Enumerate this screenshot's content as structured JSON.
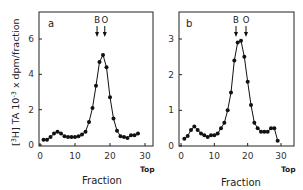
{
  "figure": {
    "ylabel_prefix": "[",
    "ylabel_iso": "3",
    "ylabel_elem": "H] TA 10",
    "ylabel_exp": "-3",
    "ylabel_suffix": " x dpm/fraction",
    "ylabel_full": "[3H] TA 10^-3 x dpm/fraction"
  },
  "chart_data": [
    {
      "type": "line",
      "panel": "a",
      "title": "",
      "xlabel": "Fraction",
      "ylabel": "[3H] TA 10^-3 x dpm/fraction",
      "x_end_label": "Top",
      "xlim": [
        0,
        32
      ],
      "ylim": [
        0,
        7.5
      ],
      "xticks": [
        0,
        10,
        20,
        30
      ],
      "yticks": [
        0,
        2,
        4,
        6
      ],
      "grid": false,
      "markers": [
        {
          "label": "B",
          "x": 16.3
        },
        {
          "label": "O",
          "x": 18.5
        }
      ],
      "x": [
        1,
        2,
        3,
        4,
        5,
        6,
        7,
        8,
        9,
        10,
        11,
        12,
        13,
        14,
        15,
        16,
        17,
        18,
        19,
        20,
        21,
        22,
        23,
        24,
        25,
        26,
        27,
        28
      ],
      "values": [
        0.3,
        0.3,
        0.45,
        0.65,
        0.75,
        0.65,
        0.5,
        0.45,
        0.45,
        0.45,
        0.5,
        0.6,
        0.75,
        1.3,
        2.1,
        3.35,
        4.7,
        5.1,
        4.4,
        2.7,
        1.5,
        0.8,
        0.5,
        0.45,
        0.4,
        0.55,
        0.55,
        0.65,
        0.3
      ]
    },
    {
      "type": "line",
      "panel": "b",
      "title": "",
      "xlabel": "Fraction",
      "ylabel": "[3H] TA 10^-3 x dpm/fraction",
      "x_end_label": "Top",
      "xlim": [
        0,
        32
      ],
      "ylim": [
        0,
        3.75
      ],
      "xticks": [
        0,
        10,
        20,
        30
      ],
      "yticks": [
        0,
        1,
        2,
        3
      ],
      "grid": false,
      "markers": [
        {
          "label": "B",
          "x": 16.5
        },
        {
          "label": "O",
          "x": 19.5
        }
      ],
      "x": [
        1,
        2,
        3,
        4,
        5,
        6,
        7,
        8,
        9,
        10,
        11,
        12,
        13,
        14,
        15,
        16,
        17,
        18,
        19,
        20,
        21,
        22,
        23,
        24,
        25,
        26,
        27,
        28,
        29
      ],
      "values": [
        0.2,
        0.28,
        0.45,
        0.55,
        0.45,
        0.35,
        0.3,
        0.25,
        0.3,
        0.3,
        0.35,
        0.5,
        0.65,
        1.0,
        1.5,
        2.4,
        2.9,
        2.95,
        2.5,
        1.8,
        1.15,
        0.65,
        0.5,
        0.4,
        0.4,
        0.4,
        0.5,
        0.5,
        0.15
      ]
    }
  ],
  "panels": [
    {
      "letter": "a",
      "xlabel": "Fraction",
      "top_label": "Top",
      "xtick_labels": [
        "0",
        "10",
        "20",
        "30"
      ],
      "ytick_labels": [
        "0",
        "2",
        "4",
        "6"
      ],
      "marker_labels": [
        "B",
        "O"
      ]
    },
    {
      "letter": "b",
      "xlabel": "Fraction",
      "top_label": "Top",
      "xtick_labels": [
        "0",
        "10",
        "20",
        "30"
      ],
      "ytick_labels": [
        "0",
        "1",
        "2",
        "3"
      ],
      "marker_labels": [
        "B",
        "O"
      ]
    }
  ]
}
